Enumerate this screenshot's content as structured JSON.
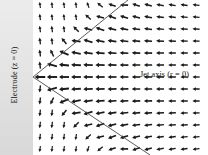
{
  "figure": {
    "name": "electric-field-vector-plot",
    "width": 208,
    "height": 155,
    "background_color": "#ffffff"
  },
  "electrode": {
    "label": "Electrode (z = 0)",
    "band_color_top": "#e8e8e8",
    "band_color_bottom": "#dcdcdc",
    "band_x": 0,
    "band_width": 33
  },
  "jet_axis": {
    "label": "Jet axis (r = 0)",
    "y": 77
  },
  "cone": {
    "stroke_color": "#4a4a4a",
    "vertex_x": 33,
    "vertex_y": 77,
    "upper_end_x": 128,
    "upper_end_y": 0,
    "lower_end_x": 150,
    "lower_end_y": 155
  },
  "arrows": {
    "color": "#1a1a1a",
    "head_color": "#1a1a1a",
    "columns": 14,
    "rows": 13,
    "x_start": 40,
    "x_step": 12,
    "y_start": 5,
    "y_step": 12
  },
  "chart_data": {
    "type": "quiver",
    "title": "",
    "xlabel": "Jet axis (r = 0)",
    "ylabel": "Electrode (z = 0)",
    "xlim": [
      0,
      208
    ],
    "ylim": [
      0,
      155
    ],
    "grid": false,
    "legend": "none"
  }
}
